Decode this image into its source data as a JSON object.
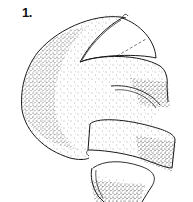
{
  "figure": {
    "label": "1.",
    "style": "stippled line drawing",
    "colors": {
      "line": "#1a1a1a",
      "stipple": "#333333",
      "background": "#ffffff"
    }
  }
}
